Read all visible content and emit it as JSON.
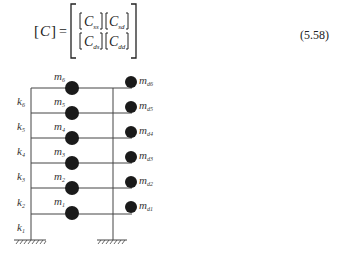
{
  "equation": {
    "lhs": "[C]",
    "equals": "=",
    "matrix": [
      [
        "C_ss",
        "C_sd"
      ],
      [
        "C_ds",
        "C_dd"
      ]
    ],
    "cells": {
      "r0c0_base": "C",
      "r0c0_sub": "ss",
      "r0c1_base": "C",
      "r0c1_sub": "sd",
      "r1c0_base": "C",
      "r1c0_sub": "ds",
      "r1c1_base": "C",
      "r1c1_sub": "dd"
    },
    "number": "(5.58)"
  },
  "figure": {
    "structure_masses": [
      "m6",
      "m5",
      "m4",
      "m3",
      "m2",
      "m1"
    ],
    "damper_masses": [
      "md6",
      "md5",
      "md4",
      "md3",
      "md2",
      "md1"
    ],
    "springs": [
      "k6",
      "k5",
      "k4",
      "k3",
      "k2",
      "k1"
    ],
    "labels": {
      "m": "m",
      "k": "k",
      "md_sub_prefix": "d"
    }
  }
}
